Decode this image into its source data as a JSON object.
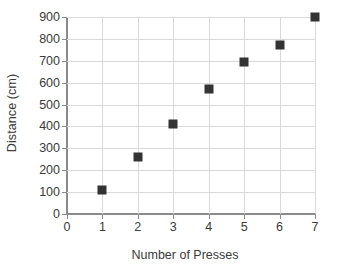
{
  "chart_data": {
    "type": "scatter",
    "title": "",
    "xlabel": "Number of Presses",
    "ylabel": "Distance (cm)",
    "xlim": [
      0,
      7
    ],
    "ylim": [
      0,
      900
    ],
    "grid": true,
    "legend": null,
    "x": [
      1,
      2,
      3,
      4,
      5,
      6,
      7
    ],
    "values": [
      110,
      260,
      410,
      570,
      695,
      770,
      900
    ],
    "points": [
      {
        "x": 1,
        "y": 110
      },
      {
        "x": 2,
        "y": 260
      },
      {
        "x": 3,
        "y": 410
      },
      {
        "x": 4,
        "y": 570
      },
      {
        "x": 5,
        "y": 695
      },
      {
        "x": 6,
        "y": 770
      },
      {
        "x": 7,
        "y": 900
      }
    ],
    "xticks": [
      "0",
      "1",
      "2",
      "3",
      "4",
      "5",
      "6",
      "7"
    ],
    "xtick_values": [
      0,
      1,
      2,
      3,
      4,
      5,
      6,
      7
    ],
    "yticks": [
      "0",
      "100",
      "200",
      "300",
      "400",
      "500",
      "600",
      "700",
      "800",
      "900"
    ],
    "ytick_values": [
      0,
      100,
      200,
      300,
      400,
      500,
      600,
      700,
      800,
      900
    ],
    "marker": "square",
    "marker_color": "#333333",
    "gridline_color": "#d9d9d9",
    "axis_color": "#8a8a8a",
    "text_color": "#3a3a3a",
    "background_color": "#ffffff"
  }
}
